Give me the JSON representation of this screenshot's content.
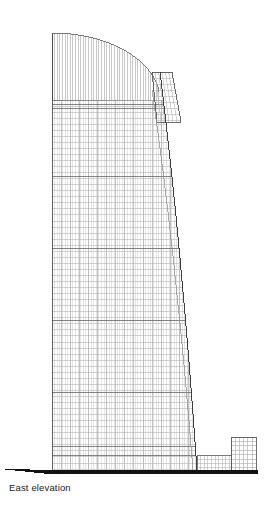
{
  "figure": {
    "caption": "East elevation",
    "type": "architectural-elevation",
    "orientation": "east",
    "background_color": "#ffffff",
    "ink_color": "#2b2b2b",
    "line_color": "#8a8a8a",
    "grid_color": "#b4b4b4",
    "fine_line_color": "#c9c9c9",
    "ground_color": "#111111"
  },
  "canvas": {
    "width": 267,
    "height": 516
  },
  "ground": {
    "name": "ground-line",
    "y": 470,
    "thickness": 3.5,
    "x_start": 44,
    "x_end": 258,
    "taper_x_start": 2,
    "taper_y_start": 468.5,
    "taper_thickness": 0.7
  },
  "tower": {
    "name": "main-tower",
    "left_x": 52,
    "base_right_x": 197,
    "base_y": 470,
    "crown_top_y": 33,
    "crown_left_top_y": 33,
    "crown_apex_x": 52,
    "crown_curve_end_x": 160,
    "crown_curve_end_y": 100,
    "body_top_y": 100,
    "mullion_spacing": 2.6,
    "floor_spacing": 6.05,
    "bay_spacing": 9.1,
    "band_y_values": [
      100,
      104,
      108,
      176,
      248,
      320,
      392,
      446,
      455
    ],
    "right_curve": {
      "top_x": 160,
      "top_y": 72,
      "control_x": 182,
      "control_y": 250,
      "bottom_x": 197,
      "bottom_y": 470
    },
    "inner_curve": {
      "top_x": 152,
      "top_y": 90,
      "control_x": 176,
      "control_y": 255,
      "bottom_x": 193,
      "bottom_y": 470
    }
  },
  "right_fin": {
    "name": "right-fin-element",
    "top_y": 72,
    "top_left_x": 152,
    "top_right_x": 172,
    "bottom_y": 122,
    "bottom_left_x": 157,
    "bottom_right_x": 181
  },
  "podium": {
    "name": "low-podium",
    "left_x": 197,
    "right_x": 231,
    "top_y": 455,
    "bottom_y": 470
  },
  "annex": {
    "name": "annex-block",
    "left_x": 231,
    "right_x": 256,
    "top_y": 437,
    "bottom_y": 470,
    "column_spacing": 4.2,
    "floor_spacing": 4.4
  }
}
